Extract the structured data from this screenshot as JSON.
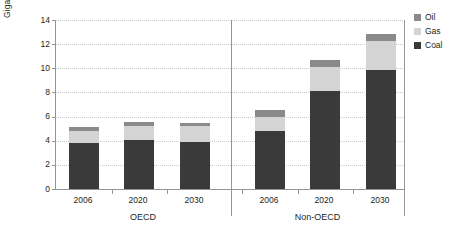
{
  "chart_data": {
    "type": "bar",
    "subtype": "stacked",
    "title": "",
    "xlabel": "",
    "ylabel": "Gigatonnes",
    "ylim": [
      0,
      14
    ],
    "yticks": [
      0,
      2,
      4,
      6,
      8,
      10,
      12,
      14
    ],
    "ytick_labels": [
      "0",
      "2",
      "4",
      "6",
      "8",
      "10",
      "12",
      "14"
    ],
    "grid": true,
    "legend_position": "right",
    "groups": [
      "OECD",
      "Non-OECD"
    ],
    "categories": [
      "2006",
      "2020",
      "2030",
      "2006",
      "2020",
      "2030"
    ],
    "category_groups": [
      "OECD",
      "OECD",
      "OECD",
      "Non-OECD",
      "Non-OECD",
      "Non-OECD"
    ],
    "series": [
      {
        "name": "Coal",
        "color": "#3a3a3a",
        "values": [
          3.8,
          4.05,
          3.9,
          4.8,
          8.1,
          9.85
        ]
      },
      {
        "name": "Gas",
        "color": "#d4d4d4",
        "values": [
          1.0,
          1.2,
          1.3,
          1.2,
          2.0,
          2.4
        ]
      },
      {
        "name": "Oil",
        "color": "#8a8a8a",
        "values": [
          0.3,
          0.3,
          0.3,
          0.55,
          0.6,
          0.6
        ]
      }
    ],
    "totals": [
      5.1,
      5.55,
      5.5,
      6.55,
      10.7,
      12.85
    ]
  },
  "legend": {
    "items": [
      {
        "label": "Oil",
        "color": "#8a8a8a"
      },
      {
        "label": "Gas",
        "color": "#d4d4d4"
      },
      {
        "label": "Coal",
        "color": "#3a3a3a"
      }
    ]
  },
  "axis": {
    "y_title": "Gigatonnes"
  }
}
